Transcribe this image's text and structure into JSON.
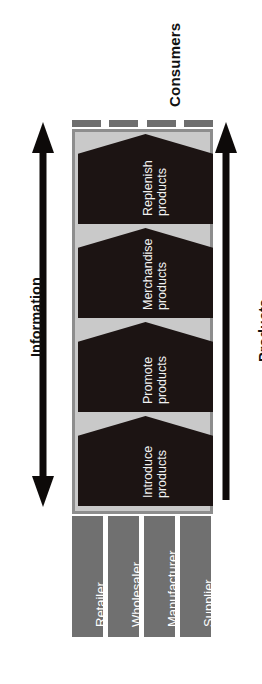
{
  "diagram": {
    "orientation": "rotated-90-ccw",
    "consumers_label": "Consumers",
    "axis_left": {
      "label": "Information",
      "arrow": "double-headed-vertical-arrow",
      "direction": "bidirectional"
    },
    "axis_right": {
      "label": "Products",
      "arrow": "single-headed-up-arrow",
      "direction": "upward"
    },
    "colors": {
      "background": "#ffffff",
      "container_fill": "#c9c9c9",
      "container_border": "#8d8d8d",
      "chevron_fill": "#1c1413",
      "chevron_text": "#f2f2f2",
      "role_bar_fill": "#707070",
      "role_bar_text": "#ffffff",
      "dash_fill": "#6e6e6e",
      "arrow_fill": "#0d0a09",
      "label_text": "#111111"
    },
    "top_segments": [
      {
        "name": "consumer-segment-1"
      },
      {
        "name": "consumer-segment-2"
      },
      {
        "name": "consumer-segment-3"
      },
      {
        "name": "consumer-segment-4"
      }
    ],
    "stages": [
      {
        "id": "replenish",
        "line1": "Replenish",
        "line2": "products"
      },
      {
        "id": "merchandise",
        "line1": "Merchandise",
        "line2": "products"
      },
      {
        "id": "promote",
        "line1": "Promote",
        "line2": "products"
      },
      {
        "id": "introduce",
        "line1": "Introduce",
        "line2": "products"
      }
    ],
    "roles": [
      {
        "id": "retailer",
        "label": "Retailer"
      },
      {
        "id": "wholesaler",
        "label": "Wholesaler"
      },
      {
        "id": "manufacturer",
        "label": "Manufacturer"
      },
      {
        "id": "supplier",
        "label": "Supplier"
      }
    ]
  }
}
